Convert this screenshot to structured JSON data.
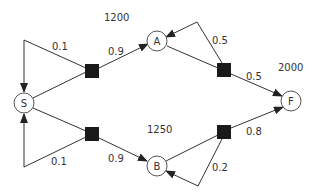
{
  "diagram": {
    "type": "state-transition-network",
    "states": {
      "S": {
        "label": "S"
      },
      "A": {
        "label": "A"
      },
      "B": {
        "label": "B"
      },
      "F": {
        "label": "F"
      }
    },
    "values": {
      "A": "1200",
      "B": "1250",
      "F": "2000"
    },
    "transitions": [
      {
        "from": "S",
        "to": "S",
        "prob": "0.1",
        "via": "top-left"
      },
      {
        "from": "S",
        "to": "A",
        "prob": "0.9",
        "via": "top-left"
      },
      {
        "from": "A",
        "to": "A",
        "prob": "0.5",
        "via": "top-right"
      },
      {
        "from": "A",
        "to": "F",
        "prob": "0.5",
        "via": "top-right"
      },
      {
        "from": "S",
        "to": "S",
        "prob": "0.1",
        "via": "bottom-left"
      },
      {
        "from": "S",
        "to": "B",
        "prob": "0.9",
        "via": "bottom-left"
      },
      {
        "from": "B",
        "to": "B",
        "prob": "0.2",
        "via": "bottom-right"
      },
      {
        "from": "B",
        "to": "F",
        "prob": "0.8",
        "via": "bottom-right"
      }
    ]
  }
}
